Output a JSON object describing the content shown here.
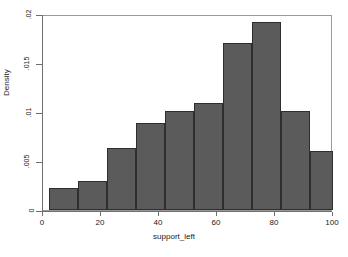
{
  "chart_data": {
    "type": "bar",
    "title": "",
    "subtitle": "",
    "xlabel": "support_left",
    "ylabel": "Density",
    "xlim": [
      0,
      100
    ],
    "ylim": [
      0,
      0.02
    ],
    "grid": false,
    "legend": null,
    "bin_width": 10.6,
    "x_ticks": [
      {
        "value": 0,
        "label": "0"
      },
      {
        "value": 20,
        "label": "20"
      },
      {
        "value": 40,
        "label": "40"
      },
      {
        "value": 60,
        "label": "60"
      },
      {
        "value": 80,
        "label": "80"
      },
      {
        "value": 100,
        "label": "100"
      }
    ],
    "y_ticks": [
      {
        "value": 0,
        "label": "0"
      },
      {
        "value": 0.005,
        "label": ".005"
      },
      {
        "value": 0.01,
        "label": ".01"
      },
      {
        "value": 0.015,
        "label": ".015"
      },
      {
        "value": 0.02,
        "label": ".02"
      }
    ],
    "bins": [
      {
        "x0": 2.0,
        "x1": 12.0,
        "value": 0.0022
      },
      {
        "x0": 12.0,
        "x1": 22.0,
        "value": 0.003
      },
      {
        "x0": 22.0,
        "x1": 32.0,
        "value": 0.0063
      },
      {
        "x0": 32.0,
        "x1": 42.0,
        "value": 0.0089
      },
      {
        "x0": 42.0,
        "x1": 52.0,
        "value": 0.0101
      },
      {
        "x0": 52.0,
        "x1": 62.0,
        "value": 0.0109
      },
      {
        "x0": 62.0,
        "x1": 72.0,
        "value": 0.017
      },
      {
        "x0": 72.0,
        "x1": 82.0,
        "value": 0.0192
      },
      {
        "x0": 82.0,
        "x1": 92.0,
        "value": 0.0101
      },
      {
        "x0": 92.0,
        "x1": 100.0,
        "value": 0.006
      }
    ],
    "categories": [
      "2-12",
      "12-22",
      "22-32",
      "32-42",
      "42-52",
      "52-62",
      "62-72",
      "72-82",
      "82-92",
      "92-100"
    ],
    "values": [
      0.0022,
      0.003,
      0.0063,
      0.0089,
      0.0101,
      0.0109,
      0.017,
      0.0192,
      0.0101,
      0.006
    ],
    "colors": {
      "bar_fill": "#5b5b5b",
      "bar_edge": "#2e2e2e",
      "axis": "#6f6f6f",
      "plot_border": "#9a9a9a",
      "background": "#ffffff",
      "text": "#1a1a1a"
    }
  }
}
